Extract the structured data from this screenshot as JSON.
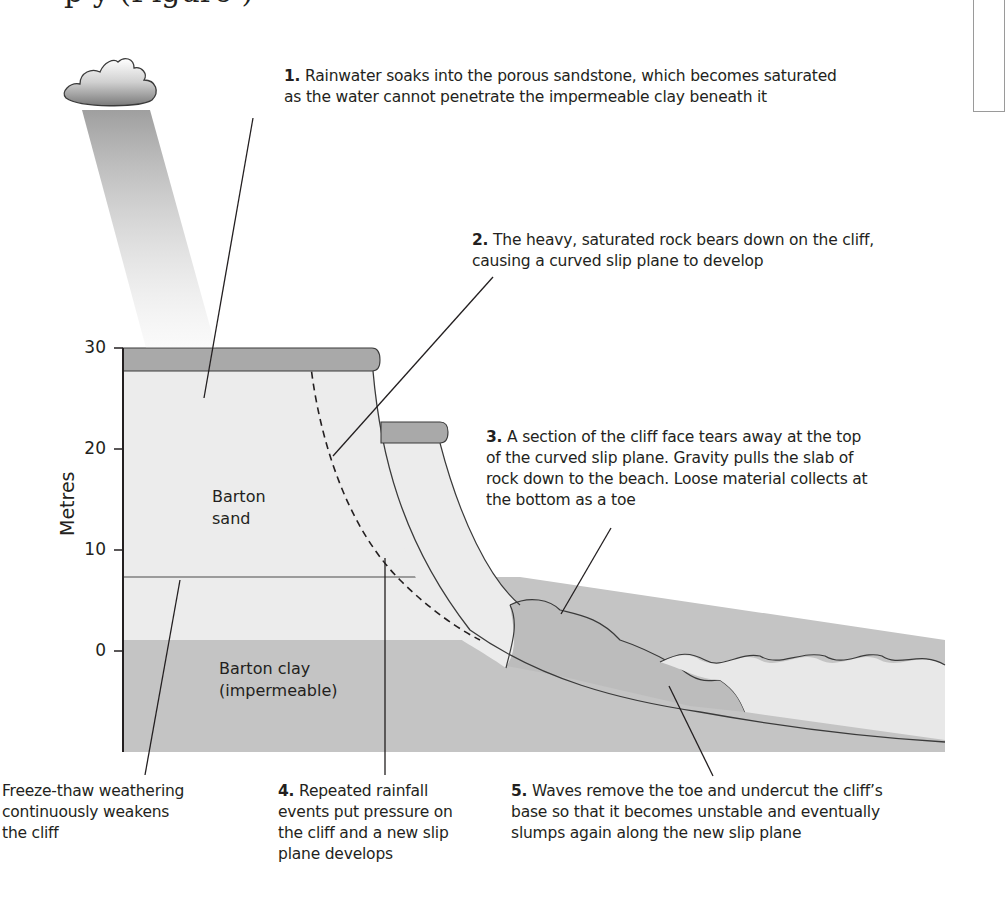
{
  "heading_clipped": "p                        y (Figure )",
  "axis": {
    "title": "Metres",
    "ticks": [
      "30",
      "20",
      "10",
      "0"
    ]
  },
  "layers": {
    "sand": [
      "Barton",
      "sand"
    ],
    "clay": [
      "Barton clay",
      "(impermeable)"
    ]
  },
  "annotations": [
    {
      "num": "1.",
      "lines": [
        "Rainwater soaks into the porous sandstone, which becomes saturated",
        "as the water cannot penetrate the impermeable clay beneath it"
      ]
    },
    {
      "num": "2.",
      "lines": [
        "The heavy, saturated rock bears down on the cliff,",
        "causing a curved slip plane to develop"
      ]
    },
    {
      "num": "3.",
      "lines": [
        "A section of the cliff face tears away at the top",
        "of the curved slip plane. Gravity pulls the slab of",
        "rock down to the beach. Loose material collects at",
        "the bottom as a toe"
      ]
    },
    {
      "num": "4.",
      "lines": [
        "Repeated rainfall",
        "events put pressure on",
        "the cliff and a new slip",
        "plane develops"
      ]
    },
    {
      "num": "5.",
      "lines": [
        "Waves remove the toe and undercut the cliff’s",
        "base so that it becomes unstable and eventually",
        "slumps again along the new slip plane"
      ]
    },
    {
      "num": "",
      "lines": [
        "Freeze-thaw weathering",
        "continuously weakens",
        "the cliff"
      ]
    }
  ],
  "colors": {
    "sand": "#ececec",
    "clay": "#c4c4c4",
    "caprock": "#a9a9a9",
    "water": "#e8e8e8",
    "line": "#231f20"
  }
}
